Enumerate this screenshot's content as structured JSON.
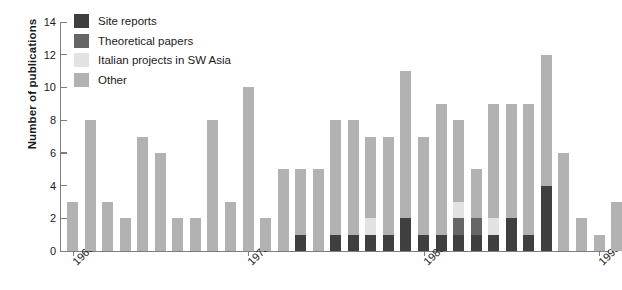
{
  "chart_data": {
    "type": "bar",
    "title": "",
    "subtitle": "",
    "xlabel": "",
    "ylabel": "Number of publications",
    "ylim": [
      0,
      14
    ],
    "yticks": [
      0,
      2,
      4,
      6,
      8,
      10,
      12,
      14
    ],
    "xticks": [
      "1968",
      "1978",
      "1988",
      "1998"
    ],
    "grid": false,
    "legend_position": "top-left",
    "stacked": true,
    "colors": {
      "site_reports": "#3f3f3f",
      "theoretical_papers": "#666666",
      "italian_projects": "#e2e2e2",
      "other": "#b2b2b2"
    },
    "legend": [
      "Site reports",
      "Theoretical papers",
      "Italian projects in SW Asia",
      "Other"
    ],
    "categories": [
      "1968",
      "1969",
      "1970",
      "1971",
      "1972",
      "1973",
      "1974",
      "1975",
      "1976",
      "1977",
      "1978",
      "1979",
      "1980",
      "1981",
      "1982",
      "1983",
      "1984",
      "1985",
      "1986",
      "1987",
      "1988",
      "1989",
      "1990",
      "1991",
      "1992",
      "1993",
      "1994",
      "1995",
      "1996",
      "1997",
      "1998"
    ],
    "series": [
      {
        "name": "Site reports",
        "values": [
          0,
          0,
          0,
          0,
          0,
          0,
          0,
          0,
          0,
          0,
          0,
          0,
          0,
          1,
          0,
          1,
          1,
          1,
          1,
          2,
          1,
          1,
          1,
          1,
          1,
          2,
          1,
          4,
          0,
          0,
          0
        ]
      },
      {
        "name": "Theoretical papers",
        "values": [
          0,
          0,
          0,
          0,
          0,
          0,
          0,
          0,
          0,
          0,
          0,
          0,
          0,
          0,
          0,
          0,
          0,
          0,
          0,
          0,
          0,
          0,
          1,
          1,
          0,
          0,
          0,
          0,
          0,
          0,
          0
        ]
      },
      {
        "name": "Italian projects in SW Asia",
        "values": [
          0,
          0,
          0,
          0,
          0,
          0,
          0,
          0,
          0,
          0,
          0,
          0,
          0,
          0,
          0,
          0,
          0,
          1,
          0,
          0,
          0,
          0,
          1,
          0,
          1,
          0,
          0,
          0,
          0,
          0,
          0
        ]
      },
      {
        "name": "Other",
        "values": [
          3,
          8,
          3,
          2,
          7,
          6,
          2,
          2,
          8,
          3,
          10,
          2,
          5,
          4,
          5,
          7,
          7,
          5,
          6,
          9,
          6,
          8,
          5,
          3,
          7,
          7,
          8,
          8,
          6,
          2,
          0
        ]
      }
    ],
    "totals": [
      3,
      8,
      3,
      2,
      7,
      6,
      2,
      2,
      8,
      3,
      10,
      2,
      5,
      5,
      5,
      8,
      8,
      7,
      7,
      11,
      7,
      10,
      8,
      5,
      9,
      9,
      9,
      12,
      6,
      2,
      0
    ],
    "extra_bars": [
      {
        "category": "1997",
        "total": 1,
        "other": 1
      },
      {
        "category": "1998",
        "total": 3,
        "other": 3
      }
    ]
  },
  "legend": {
    "items": [
      {
        "label": "Site reports",
        "key": "site_reports"
      },
      {
        "label": "Theoretical papers",
        "key": "theoretical_papers"
      },
      {
        "label": "Italian projects in SW Asia",
        "key": "italian_projects"
      },
      {
        "label": "Other",
        "key": "other"
      }
    ]
  },
  "axes": {
    "y_title": "Number of publications",
    "y_labels": [
      "0",
      "2",
      "4",
      "6",
      "8",
      "10",
      "12",
      "14"
    ],
    "x_labels": [
      "1968",
      "1978",
      "1988",
      "1998"
    ]
  }
}
